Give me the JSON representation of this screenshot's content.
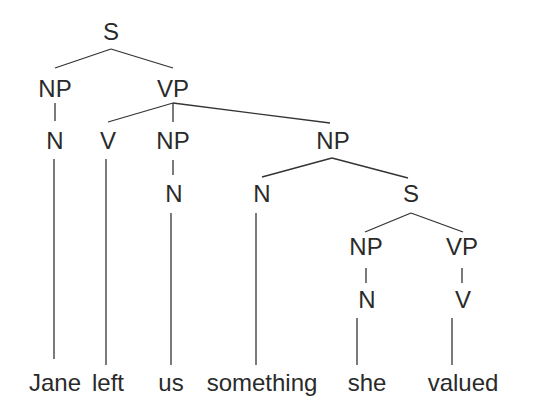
{
  "diagram": {
    "type": "syntax-tree",
    "colors": {
      "text": "#2a2a2a",
      "line": "#333333",
      "background": "#ffffff"
    },
    "nodes": [
      {
        "id": "s0",
        "label": "S",
        "x": 111,
        "y": 40
      },
      {
        "id": "np1",
        "label": "NP",
        "x": 55,
        "y": 97
      },
      {
        "id": "vp1",
        "label": "VP",
        "x": 173,
        "y": 97
      },
      {
        "id": "n1",
        "label": "N",
        "x": 55,
        "y": 149
      },
      {
        "id": "v1",
        "label": "V",
        "x": 108,
        "y": 149
      },
      {
        "id": "np2",
        "label": "NP",
        "x": 173,
        "y": 149
      },
      {
        "id": "np3",
        "label": "NP",
        "x": 333,
        "y": 149
      },
      {
        "id": "n2",
        "label": "N",
        "x": 174,
        "y": 202
      },
      {
        "id": "n3",
        "label": "N",
        "x": 262,
        "y": 202
      },
      {
        "id": "s1",
        "label": "S",
        "x": 411,
        "y": 202
      },
      {
        "id": "np4",
        "label": "NP",
        "x": 366,
        "y": 255
      },
      {
        "id": "vp2",
        "label": "VP",
        "x": 462,
        "y": 255
      },
      {
        "id": "n4",
        "label": "N",
        "x": 367,
        "y": 308
      },
      {
        "id": "v2",
        "label": "V",
        "x": 463,
        "y": 308
      }
    ],
    "words": [
      {
        "id": "w1",
        "text": "Jane",
        "x": 55,
        "y": 391
      },
      {
        "id": "w2",
        "text": "left",
        "x": 108,
        "y": 391
      },
      {
        "id": "w3",
        "text": "us",
        "x": 171,
        "y": 391
      },
      {
        "id": "w4",
        "text": "something",
        "x": 262,
        "y": 391
      },
      {
        "id": "w5",
        "text": "she",
        "x": 367,
        "y": 391
      },
      {
        "id": "w6",
        "text": "valued",
        "x": 463,
        "y": 391
      }
    ],
    "edges": [
      {
        "from": "s0",
        "to": "np1",
        "x1": 111,
        "y1": 49,
        "x2": 55,
        "y2": 68
      },
      {
        "from": "s0",
        "to": "vp1",
        "x1": 111,
        "y1": 49,
        "x2": 173,
        "y2": 68
      },
      {
        "from": "np1",
        "to": "n1",
        "x1": 55,
        "y1": 103,
        "x2": 55,
        "y2": 121
      },
      {
        "from": "vp1",
        "to": "v1",
        "x1": 173,
        "y1": 103,
        "x2": 108,
        "y2": 122
      },
      {
        "from": "vp1",
        "to": "np2",
        "x1": 173,
        "y1": 103,
        "x2": 173,
        "y2": 122
      },
      {
        "from": "vp1",
        "to": "np3",
        "x1": 173,
        "y1": 103,
        "x2": 330,
        "y2": 123
      },
      {
        "from": "np2",
        "to": "n2",
        "x1": 173,
        "y1": 160,
        "x2": 173,
        "y2": 175
      },
      {
        "from": "np3",
        "to": "n3",
        "x1": 332,
        "y1": 158,
        "x2": 262,
        "y2": 177
      },
      {
        "from": "np3",
        "to": "s1",
        "x1": 332,
        "y1": 158,
        "x2": 408,
        "y2": 178
      },
      {
        "from": "s1",
        "to": "np4",
        "x1": 411,
        "y1": 213,
        "x2": 365,
        "y2": 232
      },
      {
        "from": "s1",
        "to": "vp2",
        "x1": 411,
        "y1": 213,
        "x2": 463,
        "y2": 232
      },
      {
        "from": "np4",
        "to": "n4",
        "x1": 366,
        "y1": 268,
        "x2": 366,
        "y2": 283
      },
      {
        "from": "vp2",
        "to": "v2",
        "x1": 462,
        "y1": 268,
        "x2": 462,
        "y2": 283
      },
      {
        "from": "n1",
        "to": "w1",
        "x1": 54,
        "y1": 159,
        "x2": 54,
        "y2": 359
      },
      {
        "from": "v1",
        "to": "w2",
        "x1": 106,
        "y1": 159,
        "x2": 106,
        "y2": 365
      },
      {
        "from": "n2",
        "to": "w3",
        "x1": 171,
        "y1": 213,
        "x2": 171,
        "y2": 365
      },
      {
        "from": "n3",
        "to": "w4",
        "x1": 256,
        "y1": 213,
        "x2": 256,
        "y2": 365
      },
      {
        "from": "n4",
        "to": "w5",
        "x1": 357,
        "y1": 318,
        "x2": 357,
        "y2": 365
      },
      {
        "from": "v2",
        "to": "w6",
        "x1": 452,
        "y1": 318,
        "x2": 452,
        "y2": 365
      }
    ]
  }
}
